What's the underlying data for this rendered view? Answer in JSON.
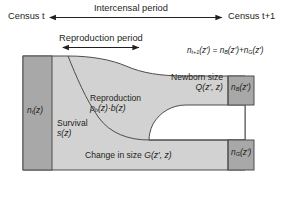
{
  "figure": {
    "kind": "ipm-life-cycle-diagram",
    "width": 287,
    "height": 199
  },
  "timeline": {
    "census_start": "Census t",
    "census_end": "Census t+1",
    "intercensal_label": "Intercensal period",
    "reproduction_label": "Reproduction period"
  },
  "equation": {
    "text": "n",
    "lhs_sub": "t+1",
    "lhs_arg": "(z′) = ",
    "term1": "n",
    "term1_sub": "B",
    "term1_arg": "(z′)+",
    "term2": "n",
    "term2_sub": "G",
    "term2_arg": "(z′)",
    "full": "n_t+1(z′) = n_B(z′)+n_G(z′)"
  },
  "columns": {
    "left": {
      "symbol": "n",
      "sub": "t",
      "arg": "(z)",
      "full": "n_t(z)"
    },
    "right_top": {
      "symbol": "n",
      "sub": "B",
      "arg": "(z′)",
      "full": "n_B(z′)"
    },
    "right_bottom": {
      "symbol": "n",
      "sub": "G",
      "arg": "(z′)",
      "full": "n_G(z′)"
    }
  },
  "regions": {
    "survival": {
      "line1": "Survival",
      "line2_sym": "s",
      "line2_arg": "(z)",
      "full": "Survival s(z)"
    },
    "reproduction": {
      "line1": "Reproduction",
      "line2_sym": "p",
      "line2_sub": "b",
      "line2_arg": "(z)·b(z)",
      "full": "Reproduction p_b(z)·b(z)"
    },
    "newborn": {
      "line1": "Newborn size",
      "line2_sym": "Q",
      "line2_arg": "(z′, z)",
      "full": "Newborn size Q(z′, z)"
    },
    "growth": {
      "line1_text": "Change in size ",
      "line1_sym": "G",
      "line1_arg": "(z′, z)",
      "full": "Change in size G(z′, z)"
    }
  },
  "colors": {
    "column_fill": "#a8a8a8",
    "body_fill": "#d2d2d2",
    "outline": "#4d4d4d",
    "text": "#231f20",
    "arrow": "#231f20",
    "background": "#ffffff"
  }
}
